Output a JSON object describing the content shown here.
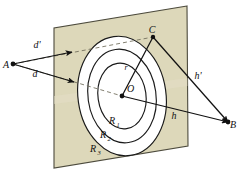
{
  "figure": {
    "background_color": "#ffffff",
    "plane_fill": "#ddd8ba",
    "plane_stroke": "#4c4a3c",
    "ring_fill": "#ffffff",
    "ring_stroke": "#1a1a1a",
    "line_color": "#111111",
    "dash_color": "#6e6a58"
  },
  "points": {
    "A": {
      "label": "A",
      "x": 13,
      "y": 64,
      "label_x": 6,
      "label_y": 68
    },
    "B": {
      "label": "B",
      "x": 228,
      "y": 122,
      "label_x": 230,
      "label_y": 128
    },
    "C": {
      "label": "C",
      "x": 153,
      "y": 37,
      "label_x": 152,
      "label_y": 33
    },
    "O": {
      "label": "O",
      "x": 122,
      "y": 96,
      "label_x": 127,
      "label_y": 92
    }
  },
  "segments": {
    "d_prime": {
      "label": "d'",
      "label_x": 37,
      "label_y": 48,
      "from": "A",
      "to": "C",
      "style": "dashed"
    },
    "d": {
      "label": "d",
      "label_x": 35,
      "label_y": 77,
      "from": "A",
      "to": "O",
      "style": "dashed"
    },
    "h_prime": {
      "label": "h'",
      "label_x": 198,
      "label_y": 79,
      "from": "C",
      "to": "B",
      "style": "solid"
    },
    "h": {
      "label": "h",
      "label_x": 174,
      "label_y": 119,
      "from": "O",
      "to": "B",
      "style": "solid"
    },
    "r": {
      "label": "r",
      "label_x": 126,
      "label_y": 70,
      "from": "O",
      "to": "C",
      "style": "solid"
    }
  },
  "rings": [
    {
      "label": "R",
      "subscript": "1",
      "label_x": 112,
      "label_y": 124,
      "rx": 24,
      "ry": 33
    },
    {
      "label": "R",
      "subscript": "2",
      "label_x": 103,
      "label_y": 138,
      "rx": 34,
      "ry": 47
    },
    {
      "label": "R",
      "subscript": "3",
      "label_x": 93,
      "label_y": 152,
      "rx": 44,
      "ry": 60
    }
  ],
  "plane": {
    "corners": "187,6 54,28 54,168 188,146",
    "name": "screen-plane"
  }
}
